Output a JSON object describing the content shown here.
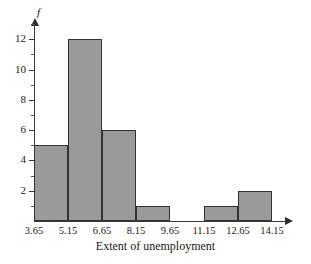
{
  "chart_data": {
    "type": "bar",
    "title": "",
    "xlabel": "Extent of unemployment",
    "ylabel": "f",
    "bin_edges": [
      3.65,
      5.15,
      6.65,
      8.15,
      9.65,
      11.15,
      12.65,
      14.15
    ],
    "categories": [
      "3.65-5.15",
      "5.15-6.65",
      "6.65-8.15",
      "8.15-9.65",
      "9.65-11.15",
      "11.15-12.65",
      "12.65-14.15"
    ],
    "values": [
      5,
      12,
      6,
      1,
      0,
      1,
      2
    ],
    "ylim": [
      0,
      13
    ],
    "ytick_major": [
      "2",
      "4",
      "6",
      "8",
      "10",
      "12"
    ],
    "ytick_major_values": [
      2,
      4,
      6,
      8,
      10,
      12
    ],
    "ytick_minor_values": [
      1,
      3,
      5,
      7,
      9,
      11,
      13
    ],
    "xtick_labels": [
      "3.65",
      "5.15",
      "6.65",
      "8.15",
      "9.65",
      "11.15",
      "12.65",
      "14.15"
    ],
    "grid": false,
    "legend": null,
    "axis_break_x": true,
    "bar_fill_color": "#9a9a9a",
    "bar_border_color": "#333333",
    "axis_color": "#3a3a3a",
    "background_color": "#ffffff"
  }
}
